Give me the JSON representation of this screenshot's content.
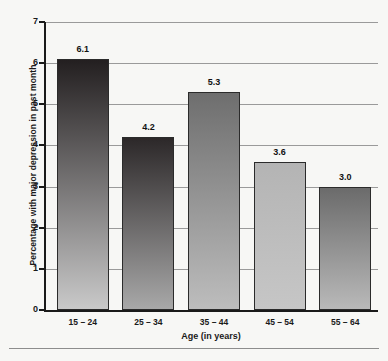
{
  "chart_data": {
    "type": "bar",
    "title": "",
    "xlabel": "Age (in years)",
    "ylabel": "Percentage with major depression in past month",
    "categories": [
      "15 – 24",
      "25 – 34",
      "35 – 44",
      "45 – 54",
      "55 – 64"
    ],
    "values": [
      6.1,
      4.2,
      5.3,
      3.6,
      3.0
    ],
    "value_labels": [
      "6.1",
      "4.2",
      "5.3",
      "3.6",
      "3.0"
    ],
    "ylim": [
      0,
      7
    ],
    "yticks": [
      0,
      1,
      2,
      3,
      4,
      5,
      6,
      7
    ],
    "ytick_labels": [
      "0",
      "1",
      "2",
      "3",
      "4",
      "5",
      "6",
      "7"
    ],
    "grid": "horizontal",
    "legend": "none",
    "bar_colors": [
      {
        "top": "#231f20",
        "bottom": "#c9c9c9"
      },
      {
        "top": "#2c2829",
        "bottom": "#a8a8a8"
      },
      {
        "top": "#6e6e6e",
        "bottom": "#bdbdbd"
      },
      {
        "top": "#b4b4b4",
        "bottom": "#c6c6c6"
      },
      {
        "top": "#6b6b6b",
        "bottom": "#b9b9b9"
      }
    ],
    "gridline_color": "#9a9a9a",
    "axis_color": "#1a1a1a",
    "background_color": "#f7f7f5"
  }
}
